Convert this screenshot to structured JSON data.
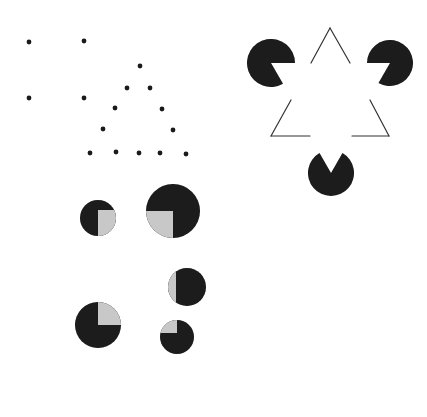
{
  "figure": {
    "width": 427,
    "height": 417,
    "background": "#ffffff",
    "ink_color": "#1a1a1a",
    "light_fill": "#c8c8c8",
    "panels": {
      "dot_pattern": {
        "description": "Dot grid forming a square of four dots and a triangle of dots",
        "dot_radius": 2.4,
        "dots": [
          [
            29,
            42
          ],
          [
            84,
            41
          ],
          [
            29,
            98
          ],
          [
            84,
            98
          ],
          [
            140,
            66
          ],
          [
            127,
            88
          ],
          [
            150,
            88
          ],
          [
            115,
            108
          ],
          [
            162,
            109
          ],
          [
            103,
            129
          ],
          [
            173,
            130
          ],
          [
            90,
            153
          ],
          [
            116,
            152
          ],
          [
            139,
            153
          ],
          [
            160,
            153
          ],
          [
            186,
            154
          ]
        ]
      },
      "kanizsa_triangle": {
        "description": "Kanizsa illusory triangle: three pac-man discs and an outlined triangle with gaps",
        "pacmen": [
          {
            "cx": 271,
            "cy": 63,
            "r": 24,
            "mouth_start_deg": 0,
            "mouth_end_deg": 60
          },
          {
            "cx": 390,
            "cy": 63,
            "r": 23,
            "mouth_start_deg": 120,
            "mouth_end_deg": 180
          },
          {
            "cx": 331,
            "cy": 173,
            "r": 23,
            "mouth_start_deg": 240,
            "mouth_end_deg": 300
          }
        ],
        "outline_segments": [
          [
            311,
            63,
            330,
            28
          ],
          [
            330,
            28,
            350,
            63
          ],
          [
            291,
            100,
            271,
            136
          ],
          [
            271,
            136,
            310,
            136
          ],
          [
            352,
            136,
            389,
            136
          ],
          [
            389,
            136,
            370,
            100
          ]
        ],
        "stroke_width": 1.2
      },
      "quadrant_discs": {
        "description": "Dark discs with a lighter quadrant/segment suggesting illusory square",
        "discs": [
          {
            "cx": 98,
            "cy": 218,
            "r": 18,
            "light": {
              "x": 98,
              "y": 210,
              "w": 20,
              "h": 27
            }
          },
          {
            "cx": 173,
            "cy": 211,
            "r": 27,
            "light": {
              "x": 146,
              "y": 211,
              "w": 27,
              "h": 27
            }
          },
          {
            "cx": 187,
            "cy": 287,
            "r": 19,
            "light": {
              "x": 168,
              "y": 268,
              "w": 8,
              "h": 38
            }
          },
          {
            "cx": 98,
            "cy": 325,
            "r": 23,
            "light": {
              "x": 98,
              "y": 302,
              "w": 23,
              "h": 23
            }
          },
          {
            "cx": 177,
            "cy": 337,
            "r": 17,
            "light": {
              "x": 160,
              "y": 320,
              "w": 17,
              "h": 13
            }
          }
        ]
      }
    }
  }
}
